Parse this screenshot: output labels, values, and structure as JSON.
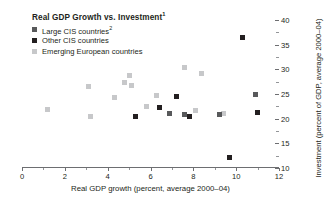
{
  "chart_data": {
    "type": "scatter",
    "title": "Real GDP Growth vs. Investment",
    "title_footnote": "1",
    "xlabel": "Real GDP growth (percent, average 2000–04)",
    "ylabel": "Investment (percent of GDP, average 2000–04)",
    "xlim": [
      0,
      12
    ],
    "ylim": [
      10,
      40
    ],
    "xticks": [
      0,
      2,
      4,
      6,
      8,
      10,
      12
    ],
    "xtick_labels": [
      "0",
      "2",
      "4",
      "6",
      "8",
      "10",
      "12"
    ],
    "xminor": [
      1,
      3,
      5,
      7,
      9,
      11
    ],
    "yticks": [
      10,
      15,
      20,
      25,
      30,
      35,
      40
    ],
    "ytick_labels": [
      "10",
      "15",
      "20",
      "25",
      "30",
      "35",
      "40"
    ],
    "yminor": [
      12.5,
      17.5,
      22.5,
      27.5,
      32.5,
      37.5
    ],
    "grid": false,
    "y_axis_side": "right",
    "legend_position": "top-left",
    "series": [
      {
        "name": "Large CIS countries",
        "footnote": "2",
        "key": "large",
        "color": "#58595b",
        "points": [
          [
            6.9,
            21.1
          ],
          [
            9.2,
            20.9
          ],
          [
            10.9,
            24.8
          ],
          [
            7.6,
            20.8
          ]
        ]
      },
      {
        "name": "Other CIS countries",
        "key": "other",
        "color": "#231f20",
        "points": [
          [
            5.3,
            20.4
          ],
          [
            6.4,
            22.2
          ],
          [
            7.2,
            24.5
          ],
          [
            7.8,
            20.5
          ],
          [
            10.3,
            36.5
          ],
          [
            11.0,
            21.2
          ],
          [
            9.7,
            12.1
          ]
        ]
      },
      {
        "name": "Emerging European countries",
        "key": "euro",
        "color": "#c7c8ca",
        "points": [
          [
            1.2,
            21.8
          ],
          [
            3.2,
            20.4
          ],
          [
            3.1,
            26.5
          ],
          [
            4.3,
            24.2
          ],
          [
            4.8,
            27.4
          ],
          [
            5.0,
            28.8
          ],
          [
            5.1,
            26.8
          ],
          [
            5.8,
            22.5
          ],
          [
            6.3,
            24.7
          ],
          [
            7.6,
            30.4
          ],
          [
            8.4,
            29.1
          ],
          [
            8.1,
            21.6
          ],
          [
            9.4,
            21.0
          ]
        ]
      }
    ]
  },
  "legend": [
    {
      "label": "Large CIS countries",
      "footnote": "2",
      "key": "large"
    },
    {
      "label": "Other CIS countries",
      "footnote": "",
      "key": "other"
    },
    {
      "label": "Emerging European countries",
      "footnote": "",
      "key": "euro"
    }
  ]
}
